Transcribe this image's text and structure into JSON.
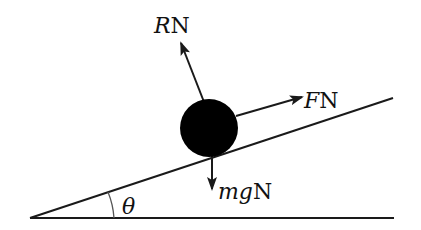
{
  "diagram": {
    "type": "force-diagram",
    "colors": {
      "line": "#1a1a1a",
      "ball": "#000000",
      "arc": "#555555",
      "background": "#ffffff"
    },
    "forces": [
      {
        "id": "R",
        "symbol": "R",
        "unit": "N",
        "direction": "normal to plane (up-left)"
      },
      {
        "id": "F",
        "symbol": "F",
        "unit": "N",
        "direction": "up the slope"
      },
      {
        "id": "mg",
        "symbol": "mg",
        "unit": "N",
        "direction": "vertically downward"
      }
    ],
    "angle": {
      "symbol": "θ",
      "description": "angle of inclination"
    }
  },
  "labels": {
    "R_symbol": "R",
    "R_unit": "N",
    "F_symbol": "F",
    "F_unit": "N",
    "mg_symbol": "mg",
    "mg_unit": "N",
    "theta": "θ"
  }
}
